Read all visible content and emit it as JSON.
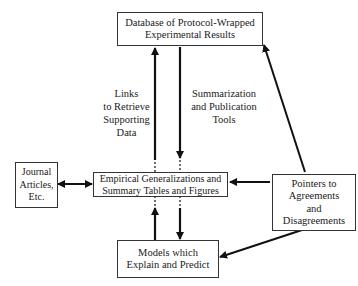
{
  "diagram": {
    "nodes": {
      "database": {
        "lines": [
          "Database of Protocol-Wrapped",
          "Experimental Results"
        ]
      },
      "empirical": {
        "lines": [
          "Empirical Generalizations and",
          "Summary Tables and Figures"
        ]
      },
      "journal": {
        "lines": [
          "Journal",
          "Articles,",
          "Etc."
        ]
      },
      "pointers": {
        "lines": [
          "Pointers to",
          "Agreements",
          "and",
          "Disagreements"
        ]
      },
      "models": {
        "lines": [
          "Models which",
          "Explain and Predict"
        ]
      }
    },
    "edge_labels": {
      "links": {
        "lines": [
          "Links",
          "to Retrieve",
          "Supporting",
          "Data"
        ]
      },
      "summarization": {
        "lines": [
          "Summarization",
          "and Publication",
          "Tools"
        ]
      }
    },
    "edges": [
      {
        "from": "empirical",
        "to": "database",
        "label": "links"
      },
      {
        "from": "database",
        "to": "empirical",
        "label": "summarization"
      },
      {
        "from": "journal",
        "to": "empirical",
        "bidirectional": true
      },
      {
        "from": "pointers",
        "to": "empirical"
      },
      {
        "from": "pointers",
        "to": "database"
      },
      {
        "from": "pointers",
        "to": "models"
      },
      {
        "from": "models",
        "to": "empirical"
      },
      {
        "from": "empirical",
        "to": "models"
      }
    ]
  }
}
